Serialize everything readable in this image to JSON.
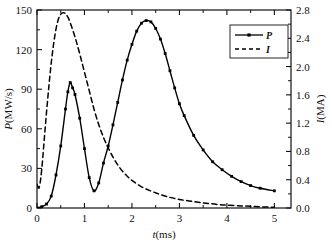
{
  "chart_data": {
    "type": "line",
    "title": "",
    "xlabel": "t(ms)",
    "ylabel": "P(MW/s)",
    "y2label": "I(MA)",
    "xlim": [
      0,
      5.35
    ],
    "ylim": [
      0,
      150
    ],
    "y2lim": [
      0,
      2.8
    ],
    "grid": false,
    "legend_position": "top-right",
    "xticks": [
      "0",
      "1",
      "2",
      "3",
      "4",
      "5"
    ],
    "xtick_values": [
      0,
      1,
      2,
      3,
      4,
      5
    ],
    "yticks": [
      "0",
      "30",
      "60",
      "90",
      "120",
      "150"
    ],
    "ytick_values": [
      0,
      30,
      60,
      90,
      120,
      150
    ],
    "y2ticks": [
      "0.0",
      "0.4",
      "0.8",
      "1.2",
      "1.6",
      "2.0",
      "2.4",
      "2.8"
    ],
    "y2tick_values": [
      0.0,
      0.4,
      0.8,
      1.2,
      1.6,
      2.0,
      2.4,
      2.8
    ],
    "series": [
      {
        "name": "P",
        "axis": "left",
        "style": "solid-with-markers",
        "marker": "square",
        "color": "#000000",
        "x": [
          0.0,
          0.1,
          0.2,
          0.3,
          0.4,
          0.5,
          0.6,
          0.65,
          0.7,
          0.75,
          0.8,
          0.9,
          1.0,
          1.1,
          1.2,
          1.3,
          1.4,
          1.5,
          1.6,
          1.7,
          1.8,
          1.9,
          2.0,
          2.1,
          2.2,
          2.3,
          2.4,
          2.5,
          2.6,
          2.7,
          2.8,
          2.9,
          3.0,
          3.1,
          3.3,
          3.5,
          3.7,
          3.9,
          4.1,
          4.3,
          4.5,
          4.7,
          5.0
        ],
        "y": [
          0,
          1,
          3,
          9,
          25,
          47,
          75,
          88,
          95,
          91,
          86,
          68,
          45,
          23,
          13,
          19,
          34,
          47,
          63,
          80,
          97,
          112,
          124,
          134,
          140,
          142,
          141,
          136,
          128,
          117,
          104,
          91,
          79,
          70,
          55,
          44,
          35,
          29,
          24,
          20,
          17,
          15,
          13
        ]
      },
      {
        "name": "I",
        "axis": "right",
        "style": "dashed",
        "color": "#000000",
        "x": [
          0.0,
          0.05,
          0.1,
          0.15,
          0.2,
          0.25,
          0.3,
          0.35,
          0.4,
          0.45,
          0.5,
          0.55,
          0.6,
          0.65,
          0.7,
          0.8,
          0.9,
          1.0,
          1.1,
          1.2,
          1.3,
          1.4,
          1.5,
          1.6,
          1.7,
          1.8,
          1.9,
          2.0,
          2.2,
          2.4,
          2.6,
          2.8,
          3.0,
          3.2,
          3.4,
          3.6,
          3.8,
          4.0,
          4.3,
          4.6,
          5.0
        ],
        "y": [
          0.33,
          0.3,
          0.55,
          0.95,
          1.35,
          1.72,
          2.05,
          2.32,
          2.53,
          2.67,
          2.74,
          2.76,
          2.75,
          2.7,
          2.62,
          2.42,
          2.18,
          1.92,
          1.66,
          1.4,
          1.18,
          1.0,
          0.85,
          0.72,
          0.61,
          0.52,
          0.45,
          0.39,
          0.3,
          0.24,
          0.19,
          0.15,
          0.12,
          0.1,
          0.08,
          0.065,
          0.05,
          0.04,
          0.03,
          0.02,
          0.01
        ]
      }
    ],
    "legend": [
      {
        "label": "P",
        "style": "solid-with-marker"
      },
      {
        "label": "I",
        "style": "dashed"
      }
    ]
  },
  "figure": {
    "background": "#ffffff",
    "axis_color": "#111111"
  }
}
